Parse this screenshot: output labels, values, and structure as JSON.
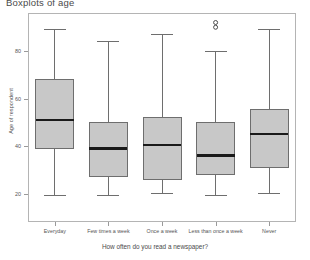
{
  "chart_data": {
    "type": "box",
    "title": "Boxplots of age",
    "xlabel": "How often do you read a newspaper?",
    "ylabel": "Age of respondent",
    "ylim": [
      8,
      96
    ],
    "yticks": [
      20,
      40,
      60,
      80
    ],
    "ytick_labels": [
      "20",
      "40",
      "60",
      "80"
    ],
    "grid": false,
    "legend": null,
    "box_fill_color": "#c8c8c8",
    "box_edge_color": "#6e6e6e",
    "median_color": "#1a1a1a",
    "whisker_color": "#6e6e6e",
    "categories": [
      "Everyday",
      "Few times a week",
      "Once a week",
      "Less than once a week",
      "Never"
    ],
    "boxes": [
      {
        "category": "Everyday",
        "whisker_low": 19,
        "q1": 39,
        "median": 51,
        "q3": 68,
        "whisker_high": 89,
        "outliers": []
      },
      {
        "category": "Few times a week",
        "whisker_low": 19,
        "q1": 27,
        "median": 39,
        "q3": 50,
        "whisker_high": 84,
        "outliers": []
      },
      {
        "category": "Once a week",
        "whisker_low": 20,
        "q1": 26,
        "median": 40.5,
        "q3": 52,
        "whisker_high": 87,
        "outliers": []
      },
      {
        "category": "Less than once a week",
        "whisker_low": 19,
        "q1": 28,
        "median": 36,
        "q3": 50,
        "whisker_high": 80,
        "outliers": [
          90,
          92
        ]
      },
      {
        "category": "Never",
        "whisker_low": 20,
        "q1": 31,
        "median": 45,
        "q3": 55.5,
        "whisker_high": 89,
        "outliers": []
      }
    ]
  }
}
